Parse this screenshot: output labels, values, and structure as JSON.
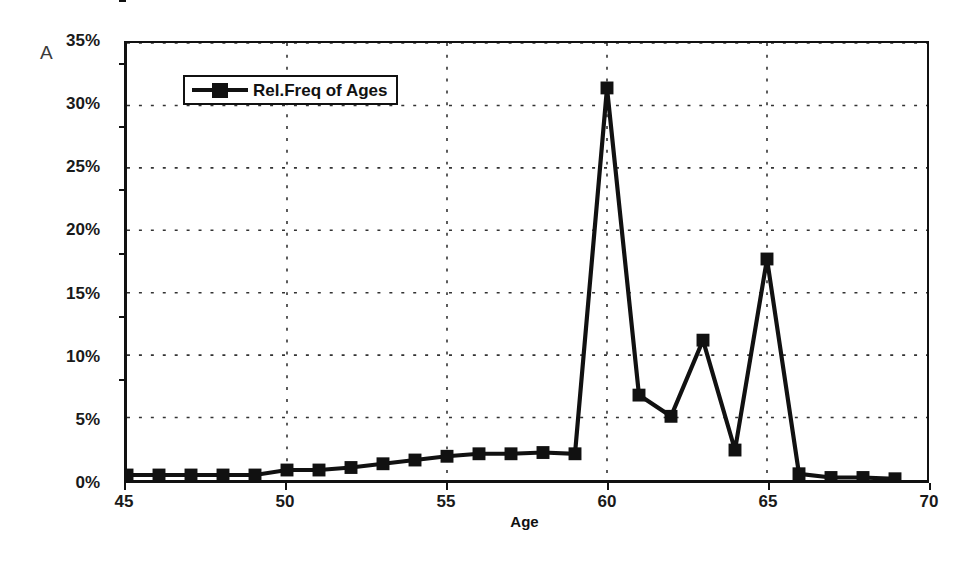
{
  "panel": {
    "letter": "A"
  },
  "legend": {
    "entries": [
      {
        "label": "Rel.Freq of Ages",
        "symbol": "square-marker-line",
        "color": "#111111"
      }
    ],
    "position": "inside-top-left"
  },
  "axes": {
    "x": {
      "title": "Age",
      "ticks": [
        45,
        50,
        55,
        60,
        65,
        70
      ],
      "tick_labels": [
        "45",
        "50",
        "55",
        "60",
        "65",
        "70"
      ],
      "min": 45,
      "max": 70
    },
    "y": {
      "title": "",
      "ticks": [
        0,
        5,
        10,
        15,
        20,
        25,
        30,
        35
      ],
      "tick_labels": [
        "0%",
        "5%",
        "10%",
        "15%",
        "20%",
        "25%",
        "30%",
        "35%"
      ],
      "min": 0,
      "max": 35
    }
  },
  "chart_data": {
    "type": "line",
    "title": "",
    "subtitle": "",
    "xlabel": "Age",
    "ylabel": "",
    "xlim": [
      45,
      70
    ],
    "ylim": [
      0,
      35
    ],
    "grid": true,
    "grid_style": "dotted",
    "legend_position": "inside-top-left",
    "annotations": [
      {
        "text": "A",
        "position": "outside-top-left"
      }
    ],
    "x": [
      45,
      46,
      47,
      48,
      49,
      50,
      51,
      52,
      53,
      54,
      55,
      56,
      57,
      58,
      59,
      60,
      61,
      62,
      63,
      64,
      65,
      66,
      67,
      68,
      69
    ],
    "series": [
      {
        "name": "Rel.Freq of Ages",
        "marker": "square",
        "color": "#111111",
        "values": [
          0.4,
          0.4,
          0.4,
          0.4,
          0.4,
          0.8,
          0.8,
          1.0,
          1.3,
          1.6,
          1.9,
          2.1,
          2.1,
          2.2,
          2.1,
          31.4,
          6.8,
          5.1,
          11.2,
          2.4,
          17.7,
          0.5,
          0.2,
          0.2,
          0.1
        ]
      }
    ]
  }
}
